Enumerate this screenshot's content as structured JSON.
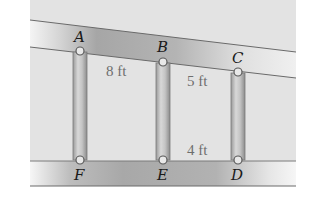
{
  "figure": {
    "points": {
      "A": "A",
      "B": "B",
      "C": "C",
      "D": "D",
      "E": "E",
      "F": "F"
    },
    "dimensions": {
      "AF": "8 ft",
      "BE": "5 ft",
      "ED": "4 ft"
    }
  },
  "colors": {
    "background_panel": "#e4e4e4",
    "beam_dark": "#a9a9a9",
    "beam_light": "#f2f2f2",
    "post": "#bdbdbd",
    "edge": "#6a6a6a"
  }
}
